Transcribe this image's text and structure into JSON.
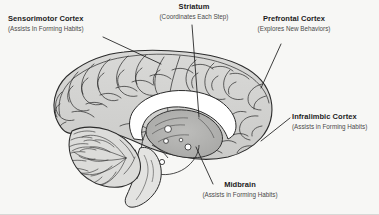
{
  "figure": {
    "background_color": "#f7f7f5",
    "line_color": "#2b2b2b",
    "title_color": "#1c1c1c",
    "subtitle_color": "#4a4a4a"
  },
  "labels": [
    {
      "key": "sensorimotor",
      "title": "Sensorimotor Cortex",
      "subtitle": "(Assists In Forming Habits)",
      "icon": "leader-line-icon"
    },
    {
      "key": "striatum",
      "title": "Striatum",
      "subtitle": "(Coordinates Each Step)",
      "icon": "leader-line-icon"
    },
    {
      "key": "prefrontal",
      "title": "Prefrontal Cortex",
      "subtitle": "(Explores New Behaviors)",
      "icon": "leader-line-icon"
    },
    {
      "key": "infralimbic",
      "title": "Infralimbic Cortex",
      "subtitle": "(Assists in Forming Habits)",
      "icon": "leader-line-icon"
    },
    {
      "key": "midbrain",
      "title": "Midbrain",
      "subtitle": "(Assists in Forming Habits)",
      "icon": "leader-line-icon"
    }
  ]
}
